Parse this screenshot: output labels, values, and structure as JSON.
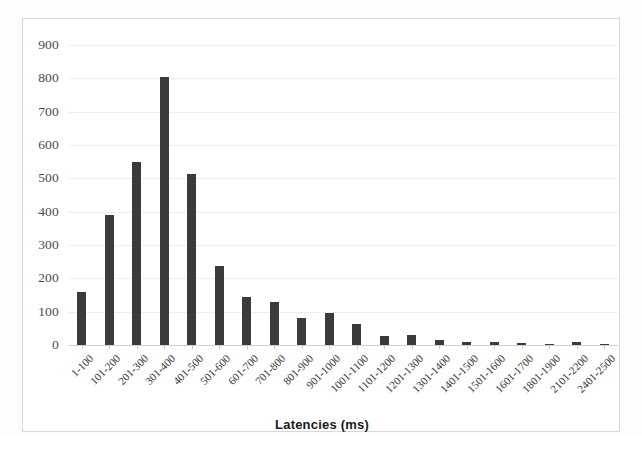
{
  "chart_data": {
    "type": "bar",
    "title": "",
    "subtitle": "",
    "xlabel": "Latencies (ms)",
    "ylabel": "",
    "ylim": [
      0,
      900
    ],
    "ytick_step": 100,
    "yticks": [
      0,
      100,
      200,
      300,
      400,
      500,
      600,
      700,
      800,
      900
    ],
    "ytick_labels": [
      "0",
      "100",
      "200",
      "300",
      "400",
      "500",
      "600",
      "700",
      "800",
      "900"
    ],
    "grid": true,
    "legend": false,
    "legend_position": "none",
    "bar_color": "#3b3b3b",
    "categories": [
      "1-100",
      "101-200",
      "201-300",
      "301-400",
      "401-500",
      "501-600",
      "601-700",
      "701-800",
      "801-900",
      "901-1000",
      "1001-1100",
      "1101-1200",
      "1201-1300",
      "1301-1400",
      "1401-1500",
      "1501-1600",
      "1601-1700",
      "1801-1900",
      "2101-2200",
      "2401-2500"
    ],
    "values": [
      158,
      390,
      548,
      805,
      512,
      237,
      145,
      130,
      82,
      97,
      62,
      28,
      30,
      14,
      10,
      8,
      5,
      4,
      9,
      3
    ]
  },
  "axis": {
    "x_title": "Latencies (ms)"
  }
}
